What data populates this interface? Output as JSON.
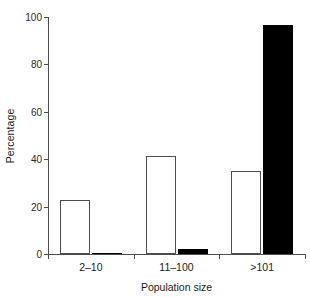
{
  "chart_data": {
    "type": "bar",
    "title": "",
    "xlabel": "Population size",
    "ylabel": "Percentage",
    "categories": [
      "2–10",
      "11–100",
      ">101"
    ],
    "series": [
      {
        "name": "open",
        "fill": "#ffffff",
        "values": [
          22.8,
          41.5,
          35.2
        ]
      },
      {
        "name": "filled",
        "fill": "#000000",
        "values": [
          0.3,
          2.1,
          96.8
        ]
      }
    ],
    "ylim": [
      0,
      100
    ],
    "yticks": [
      0,
      20,
      40,
      60,
      80,
      100
    ],
    "ytick_labels": [
      "0",
      "20",
      "40",
      "60",
      "80",
      "100"
    ],
    "grid": false,
    "legend": "none"
  },
  "axes": {
    "y_title": "Percentage",
    "x_title": "Population size"
  },
  "colors": {
    "axis": "#4d4d4d",
    "open_bar_fill": "#ffffff",
    "open_bar_edge": "#4d4d4d",
    "filled_bar": "#000000",
    "background": "#ffffff",
    "text": "#1a1a1a"
  }
}
